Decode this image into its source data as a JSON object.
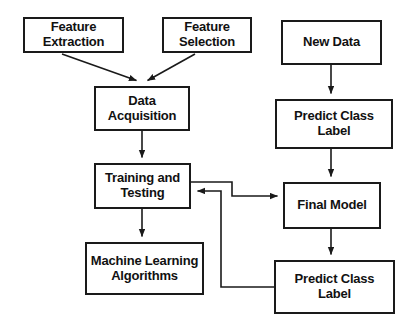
{
  "diagram": {
    "style": {
      "box_fill": "#ffffff",
      "box_border": "#1a1a1a",
      "text_color": "#111111",
      "arrow_color": "#1a1a1a",
      "background": "#ffffff"
    },
    "nodes": [
      {
        "id": "feature-extraction",
        "label": "Feature\nExtraction",
        "x": 23,
        "y": 17,
        "w": 101,
        "h": 36,
        "font_size": 13
      },
      {
        "id": "feature-selection",
        "label": "Feature\nSelection",
        "x": 162,
        "y": 17,
        "w": 90,
        "h": 36,
        "font_size": 13
      },
      {
        "id": "new-data",
        "label": "New Data",
        "x": 281,
        "y": 20,
        "w": 101,
        "h": 45,
        "font_size": 13
      },
      {
        "id": "data-acquisition",
        "label": "Data\nAcquisition",
        "x": 94,
        "y": 86,
        "w": 96,
        "h": 45,
        "font_size": 13
      },
      {
        "id": "predict-class-label-top",
        "label": "Predict Class\nLabel",
        "x": 275,
        "y": 99,
        "w": 118,
        "h": 50,
        "font_size": 13
      },
      {
        "id": "training-and-testing",
        "label": "Training and\nTesting",
        "x": 94,
        "y": 163,
        "w": 97,
        "h": 46,
        "font_size": 13
      },
      {
        "id": "final-model",
        "label": "Final Model",
        "x": 283,
        "y": 182,
        "w": 98,
        "h": 47,
        "font_size": 13
      },
      {
        "id": "machine-learning-algorithms",
        "label": "Machine Learning\nAlgorithms",
        "x": 85,
        "y": 242,
        "w": 119,
        "h": 53,
        "font_size": 13
      },
      {
        "id": "predict-class-label-bottom",
        "label": "Predict Class\nLabel",
        "x": 274,
        "y": 260,
        "w": 121,
        "h": 54,
        "font_size": 13
      }
    ],
    "edges": [
      {
        "id": "edge-feature-extraction-to-data-acquisition",
        "from": "feature-extraction",
        "to": "data-acquisition",
        "kind": "diagonal-arrow"
      },
      {
        "id": "edge-feature-selection-to-data-acquisition",
        "from": "feature-selection",
        "to": "data-acquisition",
        "kind": "diagonal-arrow"
      },
      {
        "id": "edge-data-acquisition-to-training-and-testing",
        "from": "data-acquisition",
        "to": "training-and-testing",
        "kind": "vertical-arrow"
      },
      {
        "id": "edge-training-and-testing-to-machine-learning-algorithms",
        "from": "training-and-testing",
        "to": "machine-learning-algorithms",
        "kind": "vertical-arrow"
      },
      {
        "id": "edge-new-data-to-predict-class-label-top",
        "from": "new-data",
        "to": "predict-class-label-top",
        "kind": "vertical-arrow"
      },
      {
        "id": "edge-predict-class-label-top-to-final-model",
        "from": "predict-class-label-top",
        "to": "final-model",
        "kind": "vertical-arrow"
      },
      {
        "id": "edge-final-model-to-predict-class-label-bottom",
        "from": "final-model",
        "to": "predict-class-label-bottom",
        "kind": "vertical-arrow"
      },
      {
        "id": "edge-training-and-testing-to-final-model",
        "from": "training-and-testing",
        "to": "final-model",
        "kind": "orthogonal-arrow"
      },
      {
        "id": "edge-predict-class-label-bottom-to-training-and-testing",
        "from": "predict-class-label-bottom",
        "to": "training-and-testing",
        "kind": "orthogonal-feedback-arrow"
      }
    ]
  }
}
